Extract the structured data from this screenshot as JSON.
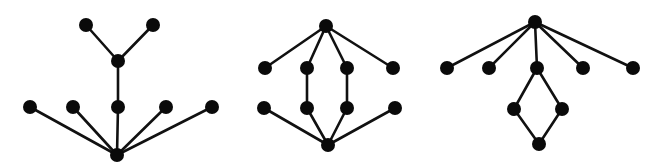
{
  "style": {
    "node_color": "#0a0a0a",
    "edge_color": "#111111",
    "background": "#ffffff",
    "node_radius": 7
  },
  "diagrams": [
    {
      "name": "diagram-1-tree",
      "nodes": [
        {
          "id": "a1",
          "x": 86,
          "y": 25
        },
        {
          "id": "a2",
          "x": 153,
          "y": 25
        },
        {
          "id": "m",
          "x": 118,
          "y": 61
        },
        {
          "id": "r1",
          "x": 30,
          "y": 107
        },
        {
          "id": "r2",
          "x": 73,
          "y": 107
        },
        {
          "id": "r3",
          "x": 118,
          "y": 107
        },
        {
          "id": "r4",
          "x": 166,
          "y": 107
        },
        {
          "id": "r5",
          "x": 212,
          "y": 107
        },
        {
          "id": "b",
          "x": 117,
          "y": 155
        }
      ],
      "edges": [
        [
          "a1",
          "m"
        ],
        [
          "a2",
          "m"
        ],
        [
          "m",
          "r3"
        ],
        [
          "r1",
          "b"
        ],
        [
          "r2",
          "b"
        ],
        [
          "r3",
          "b"
        ],
        [
          "r4",
          "b"
        ],
        [
          "r5",
          "b"
        ]
      ]
    },
    {
      "name": "diagram-2-lattice",
      "nodes": [
        {
          "id": "t",
          "x": 326,
          "y": 26
        },
        {
          "id": "u1",
          "x": 265,
          "y": 68
        },
        {
          "id": "u2",
          "x": 307,
          "y": 68
        },
        {
          "id": "u3",
          "x": 347,
          "y": 68
        },
        {
          "id": "u4",
          "x": 393,
          "y": 68
        },
        {
          "id": "l1",
          "x": 264,
          "y": 108
        },
        {
          "id": "l2",
          "x": 307,
          "y": 108
        },
        {
          "id": "l3",
          "x": 347,
          "y": 108
        },
        {
          "id": "l4",
          "x": 395,
          "y": 108
        },
        {
          "id": "b",
          "x": 328,
          "y": 145
        }
      ],
      "edges": [
        [
          "t",
          "u1"
        ],
        [
          "t",
          "u2"
        ],
        [
          "t",
          "u3"
        ],
        [
          "t",
          "u4"
        ],
        [
          "u2",
          "l2"
        ],
        [
          "u3",
          "l3"
        ],
        [
          "l1",
          "b"
        ],
        [
          "l2",
          "b"
        ],
        [
          "l3",
          "b"
        ],
        [
          "l4",
          "b"
        ]
      ]
    },
    {
      "name": "diagram-3-fan-diamond",
      "nodes": [
        {
          "id": "t",
          "x": 535,
          "y": 22
        },
        {
          "id": "c1",
          "x": 447,
          "y": 68
        },
        {
          "id": "c2",
          "x": 489,
          "y": 68
        },
        {
          "id": "c3",
          "x": 537,
          "y": 68
        },
        {
          "id": "c4",
          "x": 583,
          "y": 68
        },
        {
          "id": "c5",
          "x": 633,
          "y": 68
        },
        {
          "id": "d1",
          "x": 514,
          "y": 109
        },
        {
          "id": "d2",
          "x": 562,
          "y": 109
        },
        {
          "id": "b",
          "x": 539,
          "y": 144
        }
      ],
      "edges": [
        [
          "t",
          "c1"
        ],
        [
          "t",
          "c2"
        ],
        [
          "t",
          "c3"
        ],
        [
          "t",
          "c4"
        ],
        [
          "t",
          "c5"
        ],
        [
          "c3",
          "d1"
        ],
        [
          "c3",
          "d2"
        ],
        [
          "d1",
          "b"
        ],
        [
          "d2",
          "b"
        ]
      ]
    }
  ]
}
